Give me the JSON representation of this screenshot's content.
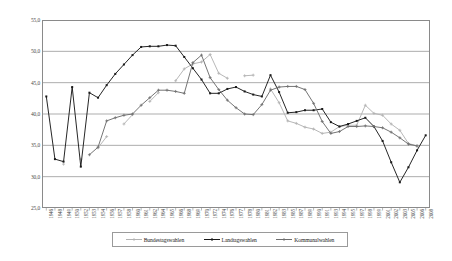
{
  "chart_data": {
    "type": "line",
    "title": "",
    "subtitle": "",
    "xlabel": "",
    "ylabel": "",
    "ylim": [
      25.0,
      55.0
    ],
    "yticks": [
      "25,0",
      "30,0",
      "35,0",
      "40,0",
      "45,0",
      "50,0",
      "55,0"
    ],
    "ytick_values": [
      25.0,
      30.0,
      35.0,
      40.0,
      45.0,
      50.0,
      55.0
    ],
    "grid": "horizontal",
    "legend_position": "bottom",
    "decimal_separator": ",",
    "categories": [
      "1946",
      "1948",
      "1949",
      "1950",
      "1952",
      "1953",
      "1954",
      "1956",
      "1957",
      "1958",
      "1960",
      "1961",
      "1962",
      "1964",
      "1965",
      "1966",
      "1968",
      "1969",
      "1970",
      "1972",
      "1974",
      "1976",
      "1977",
      "1978",
      "1980",
      "1981",
      "1982",
      "1983",
      "1985",
      "1987",
      "1989",
      "1990",
      "1991",
      "1993",
      "1994",
      "1995",
      "1997",
      "1998",
      "1999",
      "2001",
      "2002",
      "2003",
      "2005",
      "2006",
      "2008"
    ],
    "series": [
      {
        "name": "Bundestagswahlen",
        "color": "#b3b3b3",
        "marker": "cross",
        "values": [
          null,
          null,
          32.0,
          null,
          32.8,
          null,
          34.6,
          36.4,
          null,
          38.4,
          39.9,
          null,
          42.0,
          43.4,
          null,
          45.3,
          47.2,
          48.0,
          48.3,
          49.5,
          46.5,
          45.7,
          null,
          46.1,
          46.2,
          null,
          44.0,
          41.8,
          38.9,
          38.5,
          37.9,
          37.6,
          36.9,
          37.1,
          38.0,
          38.2,
          38.2,
          41.4,
          40.1,
          39.8,
          38.4,
          37.4,
          35.3,
          34.9,
          null
        ]
      },
      {
        "name": "Landtagswahlen",
        "color": "#1a1a1a",
        "marker": "square",
        "values": [
          42.8,
          32.8,
          32.4,
          44.3,
          31.6,
          43.4,
          42.6,
          44.6,
          46.4,
          47.9,
          49.4,
          50.7,
          50.8,
          50.8,
          51.0,
          50.9,
          49.1,
          47.3,
          45.5,
          43.3,
          43.3,
          44.0,
          44.3,
          43.6,
          43.1,
          42.8,
          46.2,
          43.5,
          40.2,
          40.3,
          40.6,
          40.6,
          40.8,
          38.7,
          38.0,
          38.4,
          38.9,
          39.4,
          38.0,
          35.7,
          32.3,
          29.1,
          31.5,
          34.2,
          36.6
        ]
      },
      {
        "name": "Kommunalwahlen",
        "color": "#6e6e6e",
        "marker": "cross",
        "values": [
          null,
          null,
          null,
          null,
          null,
          33.5,
          34.7,
          38.9,
          39.4,
          39.8,
          40.0,
          41.4,
          42.6,
          43.8,
          43.8,
          43.6,
          43.3,
          48.2,
          49.4,
          45.8,
          43.9,
          42.2,
          41.0,
          40.0,
          39.9,
          41.5,
          43.8,
          44.3,
          44.4,
          44.4,
          43.9,
          41.7,
          38.8,
          36.9,
          37.2,
          38.0,
          38.0,
          38.1,
          38.0,
          37.8,
          37.1,
          36.2,
          35.2,
          34.9,
          null
        ]
      }
    ],
    "legend": [
      {
        "label": "Bundestagswahlen",
        "color": "#b3b3b3",
        "marker": "cross"
      },
      {
        "label": "Landtagswahlen",
        "color": "#1a1a1a",
        "marker": "square"
      },
      {
        "label": "Kommunalwahlen",
        "color": "#6e6e6e",
        "marker": "cross"
      }
    ]
  },
  "axes": {
    "y_label_ids": [
      "55,0",
      "50,0",
      "45,0",
      "40,0",
      "35,0",
      "30,0",
      "25,0"
    ]
  }
}
